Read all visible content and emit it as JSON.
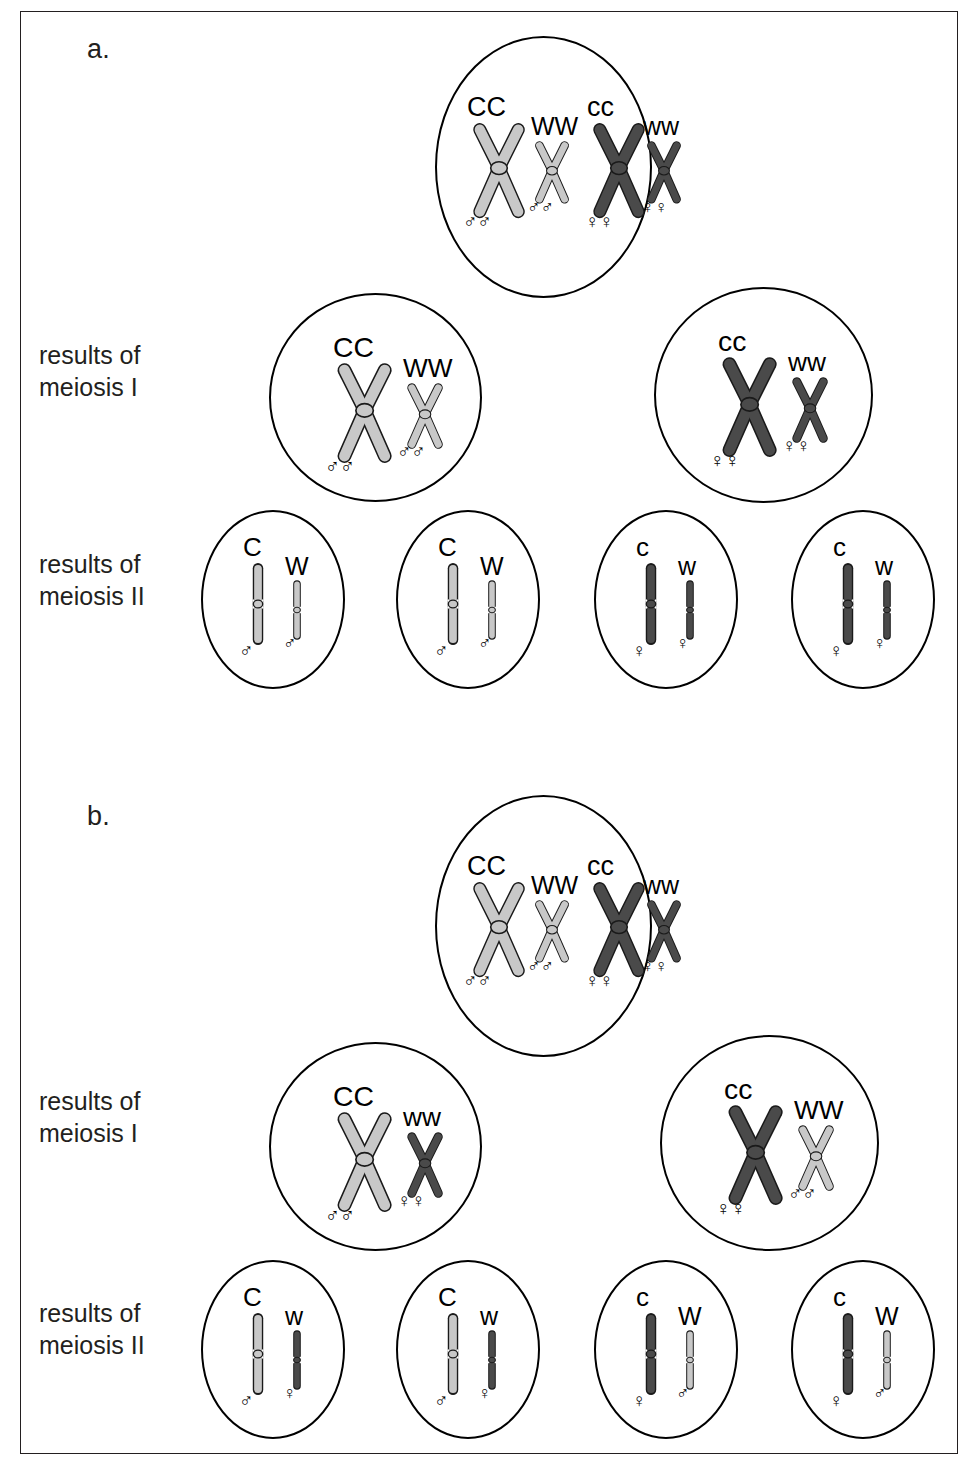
{
  "figure": {
    "panels": [
      {
        "id": "a",
        "label": "a.",
        "row_labels": [
          "results of\nmeiosis I",
          "results of\nmeiosis II"
        ],
        "parent_cell": {
          "name": "parent-cell",
          "chromosome_pairs": [
            {
              "allele": "CC",
              "shade": "light",
              "size": "large",
              "form": "x",
              "sex": [
                "male",
                "male"
              ]
            },
            {
              "allele": "WW",
              "shade": "light",
              "size": "small",
              "form": "x",
              "sex": [
                "male",
                "male"
              ]
            },
            {
              "allele": "cc",
              "shade": "dark",
              "size": "large",
              "form": "x",
              "sex": [
                "female",
                "female"
              ]
            },
            {
              "allele": "ww",
              "shade": "dark",
              "size": "small",
              "form": "x",
              "sex": [
                "female",
                "female"
              ]
            }
          ]
        },
        "meiosis1_cells": [
          {
            "name": "meiosis1-cell-left",
            "chromosome_pairs": [
              {
                "allele": "CC",
                "shade": "light",
                "size": "large",
                "form": "x",
                "sex": [
                  "male",
                  "male"
                ]
              },
              {
                "allele": "WW",
                "shade": "light",
                "size": "small",
                "form": "x",
                "sex": [
                  "male",
                  "male"
                ]
              }
            ]
          },
          {
            "name": "meiosis1-cell-right",
            "chromosome_pairs": [
              {
                "allele": "cc",
                "shade": "dark",
                "size": "large",
                "form": "x",
                "sex": [
                  "female",
                  "female"
                ]
              },
              {
                "allele": "ww",
                "shade": "dark",
                "size": "small",
                "form": "x",
                "sex": [
                  "female",
                  "female"
                ]
              }
            ]
          }
        ],
        "meiosis2_cells": [
          {
            "name": "meiosis2-cell-1",
            "chromosome_pairs": [
              {
                "allele": "C",
                "shade": "light",
                "size": "large",
                "form": "rod",
                "sex": [
                  "male"
                ]
              },
              {
                "allele": "W",
                "shade": "light",
                "size": "small",
                "form": "rod",
                "sex": [
                  "male"
                ]
              }
            ]
          },
          {
            "name": "meiosis2-cell-2",
            "chromosome_pairs": [
              {
                "allele": "C",
                "shade": "light",
                "size": "large",
                "form": "rod",
                "sex": [
                  "male"
                ]
              },
              {
                "allele": "W",
                "shade": "light",
                "size": "small",
                "form": "rod",
                "sex": [
                  "male"
                ]
              }
            ]
          },
          {
            "name": "meiosis2-cell-3",
            "chromosome_pairs": [
              {
                "allele": "c",
                "shade": "dark",
                "size": "large",
                "form": "rod",
                "sex": [
                  "female"
                ]
              },
              {
                "allele": "w",
                "shade": "dark",
                "size": "small",
                "form": "rod",
                "sex": [
                  "female"
                ]
              }
            ]
          },
          {
            "name": "meiosis2-cell-4",
            "chromosome_pairs": [
              {
                "allele": "c",
                "shade": "dark",
                "size": "large",
                "form": "rod",
                "sex": [
                  "female"
                ]
              },
              {
                "allele": "w",
                "shade": "dark",
                "size": "small",
                "form": "rod",
                "sex": [
                  "female"
                ]
              }
            ]
          }
        ]
      },
      {
        "id": "b",
        "label": "b.",
        "row_labels": [
          "results of\nmeiosis I",
          "results of\nmeiosis II"
        ],
        "parent_cell": {
          "name": "parent-cell",
          "chromosome_pairs": [
            {
              "allele": "CC",
              "shade": "light",
              "size": "large",
              "form": "x",
              "sex": [
                "male",
                "male"
              ]
            },
            {
              "allele": "WW",
              "shade": "light",
              "size": "small",
              "form": "x",
              "sex": [
                "male",
                "male"
              ]
            },
            {
              "allele": "cc",
              "shade": "dark",
              "size": "large",
              "form": "x",
              "sex": [
                "female",
                "female"
              ]
            },
            {
              "allele": "ww",
              "shade": "dark",
              "size": "small",
              "form": "x",
              "sex": [
                "female",
                "female"
              ]
            }
          ]
        },
        "meiosis1_cells": [
          {
            "name": "meiosis1-cell-left",
            "chromosome_pairs": [
              {
                "allele": "CC",
                "shade": "light",
                "size": "large",
                "form": "x",
                "sex": [
                  "male",
                  "male"
                ]
              },
              {
                "allele": "ww",
                "shade": "dark",
                "size": "small",
                "form": "x",
                "sex": [
                  "female",
                  "female"
                ]
              }
            ]
          },
          {
            "name": "meiosis1-cell-right",
            "chromosome_pairs": [
              {
                "allele": "cc",
                "shade": "dark",
                "size": "large",
                "form": "x",
                "sex": [
                  "female",
                  "female"
                ]
              },
              {
                "allele": "WW",
                "shade": "light",
                "size": "small",
                "form": "x",
                "sex": [
                  "male",
                  "male"
                ]
              }
            ]
          }
        ],
        "meiosis2_cells": [
          {
            "name": "meiosis2-cell-1",
            "chromosome_pairs": [
              {
                "allele": "C",
                "shade": "light",
                "size": "large",
                "form": "rod",
                "sex": [
                  "male"
                ]
              },
              {
                "allele": "w",
                "shade": "dark",
                "size": "small",
                "form": "rod",
                "sex": [
                  "female"
                ]
              }
            ]
          },
          {
            "name": "meiosis2-cell-2",
            "chromosome_pairs": [
              {
                "allele": "C",
                "shade": "light",
                "size": "large",
                "form": "rod",
                "sex": [
                  "male"
                ]
              },
              {
                "allele": "w",
                "shade": "dark",
                "size": "small",
                "form": "rod",
                "sex": [
                  "female"
                ]
              }
            ]
          },
          {
            "name": "meiosis2-cell-3",
            "chromosome_pairs": [
              {
                "allele": "c",
                "shade": "dark",
                "size": "large",
                "form": "rod",
                "sex": [
                  "female"
                ]
              },
              {
                "allele": "W",
                "shade": "light",
                "size": "small",
                "form": "rod",
                "sex": [
                  "male"
                ]
              }
            ]
          },
          {
            "name": "meiosis2-cell-4",
            "chromosome_pairs": [
              {
                "allele": "c",
                "shade": "dark",
                "size": "large",
                "form": "rod",
                "sex": [
                  "female"
                ]
              },
              {
                "allele": "W",
                "shade": "light",
                "size": "small",
                "form": "rod",
                "sex": [
                  "male"
                ]
              }
            ]
          }
        ]
      }
    ],
    "symbols": {
      "male": "♂",
      "female": "♀"
    },
    "colors": {
      "light_shade": "#c8c8c8",
      "dark_shade": "#4a4a4a",
      "outline": "#1a1a1a",
      "text": "#231f20",
      "frame": "#231f20"
    }
  }
}
